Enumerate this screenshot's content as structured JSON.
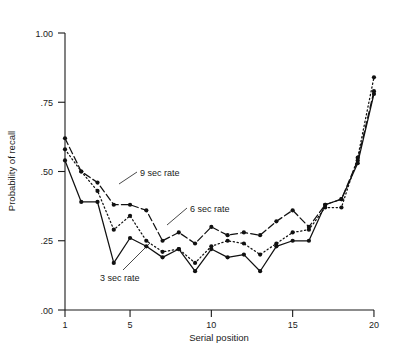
{
  "chart_data": {
    "type": "line",
    "title": "",
    "xlabel": "Serial position",
    "ylabel": "Probability of recall",
    "xlim": [
      1,
      20
    ],
    "ylim": [
      0.0,
      1.0
    ],
    "grid": false,
    "legend_position": "inline-annotations",
    "x": [
      1,
      2,
      3,
      4,
      5,
      6,
      7,
      8,
      9,
      10,
      11,
      12,
      13,
      14,
      15,
      16,
      17,
      18,
      19,
      20
    ],
    "xticks": [
      "1",
      "5",
      "10",
      "15",
      "20"
    ],
    "xtick_values": [
      1,
      5,
      10,
      15,
      20
    ],
    "yticks": [
      ".00",
      ".25",
      ".50",
      ".75",
      "1.00"
    ],
    "ytick_values": [
      0.0,
      0.25,
      0.5,
      0.75,
      1.0
    ],
    "series": [
      {
        "name": "9 sec rate",
        "style": "dashed",
        "marker": "filled-circle",
        "values": [
          0.62,
          0.5,
          0.46,
          0.38,
          0.38,
          0.36,
          0.25,
          0.28,
          0.24,
          0.3,
          0.27,
          0.28,
          0.27,
          0.32,
          0.36,
          0.3,
          0.38,
          0.4,
          0.54,
          0.79
        ]
      },
      {
        "name": "6 sec rate",
        "style": "dotted",
        "marker": "filled-circle",
        "values": [
          0.58,
          0.5,
          0.43,
          0.29,
          0.34,
          0.25,
          0.21,
          0.22,
          0.17,
          0.23,
          0.25,
          0.24,
          0.2,
          0.24,
          0.28,
          0.29,
          0.37,
          0.37,
          0.55,
          0.84
        ]
      },
      {
        "name": "3 sec rate",
        "style": "solid",
        "marker": "filled-circle",
        "values": [
          0.54,
          0.39,
          0.39,
          0.17,
          0.26,
          0.23,
          0.19,
          0.22,
          0.14,
          0.22,
          0.19,
          0.2,
          0.14,
          0.23,
          0.25,
          0.25,
          0.38,
          0.4,
          0.53,
          0.78
        ]
      }
    ],
    "annotations": [
      {
        "text": "9 sec rate",
        "x": 0.0,
        "y": 0.0
      },
      {
        "text": "6 sec rate",
        "x": 0.0,
        "y": 0.0
      },
      {
        "text": "3 sec rate",
        "x": 0.0,
        "y": 0.0
      }
    ]
  },
  "labels": {
    "xaxis": "Serial position",
    "yaxis": "Probability of recall",
    "annot_9sec": "9 sec rate",
    "annot_6sec": "6 sec rate",
    "annot_3sec": "3 sec rate",
    "ytick_100": "1.00",
    "ytick_75": ".75",
    "ytick_50": ".50",
    "ytick_25": ".25",
    "ytick_00": ".00",
    "xtick_1": "1",
    "xtick_5": "5",
    "xtick_10": "10",
    "xtick_15": "15",
    "xtick_20": "20"
  },
  "colors": {
    "ink": "#111111",
    "background": "#ffffff"
  }
}
